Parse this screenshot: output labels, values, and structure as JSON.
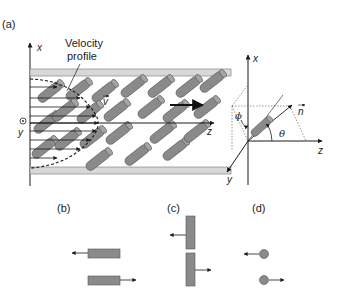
{
  "panels": {
    "a": {
      "label": "(a)",
      "annotation": "Velocity profile",
      "annotation_lines": [
        "Velocity",
        "profile"
      ],
      "axes": {
        "x": "x",
        "y": "y",
        "z": "z",
        "v": "v"
      },
      "orientation_axes": {
        "x": "x",
        "y": "y",
        "z": "z",
        "n": "n",
        "phi": "ϕ",
        "theta": "θ"
      }
    },
    "b": {
      "label": "(b)",
      "description": "Two horizontal rods moving in opposite directions"
    },
    "c": {
      "label": "(c)",
      "description": "Two vertical rods moving in opposite directions"
    },
    "d": {
      "label": "(d)",
      "description": "Two spheres moving in opposite directions"
    }
  },
  "colors": {
    "rod_fill": "#8a8a8a",
    "rod_stroke": "#444444",
    "wall": "#bdbdbd",
    "arrow": "#1a1a1a"
  }
}
